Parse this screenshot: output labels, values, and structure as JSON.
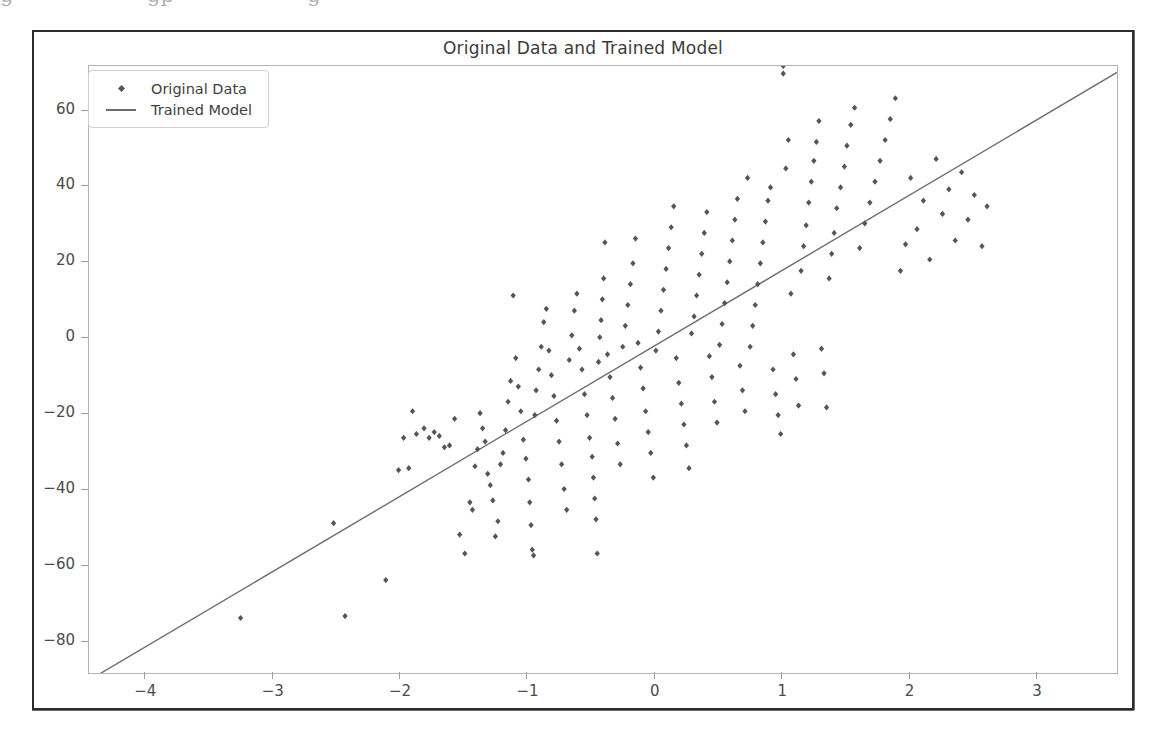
{
  "figure": {
    "title": "Original Data and Trained Model",
    "background": "#ffffff",
    "frame_color": "#2c2c2c",
    "axes_color": "#b4b4b4"
  },
  "page_artifact": {
    "cut_text_fragment": "g                    gp                    g"
  },
  "legend": {
    "position": "upper left",
    "entries": [
      {
        "label": "Original Data",
        "key": "marker",
        "color": "#555555"
      },
      {
        "label": "Trained Model",
        "key": "line",
        "color": "#6d6d6d"
      }
    ]
  },
  "chart_data": {
    "type": "scatter",
    "title": "Original Data and Trained Model",
    "xlabel": "",
    "ylabel": "",
    "xlim": [
      -4.45,
      3.62
    ],
    "ylim": [
      -88.0,
      72.0
    ],
    "xticks": [
      -4,
      -3,
      -2,
      -1,
      0,
      1,
      2,
      3
    ],
    "yticks": [
      -80,
      -60,
      -40,
      -20,
      0,
      20,
      40,
      60
    ],
    "xtick_labels": [
      "−4",
      "−3",
      "−2",
      "−1",
      "0",
      "1",
      "2",
      "3"
    ],
    "ytick_labels": [
      "−80",
      "−60",
      "−40",
      "−20",
      "0",
      "20",
      "40",
      "60"
    ],
    "grid": false,
    "legend_position": "upper left",
    "series": [
      {
        "name": "Original Data",
        "type": "scatter",
        "color": "#555555",
        "marker": "diamond",
        "marker_size": 5,
        "n_points": 200,
        "x": [
          -3.26,
          -2.53,
          -2.44,
          -2.12,
          -2.02,
          -1.98,
          -1.94,
          -1.91,
          -1.88,
          -1.82,
          -1.78,
          -1.74,
          -1.7,
          -1.66,
          -1.62,
          -1.58,
          -1.54,
          -1.5,
          -1.46,
          -1.44,
          -1.42,
          -1.4,
          -1.38,
          -1.36,
          -1.34,
          -1.32,
          -1.3,
          -1.28,
          -1.26,
          -1.24,
          -1.22,
          -1.2,
          -1.18,
          -1.16,
          -1.14,
          -1.12,
          -1.1,
          -1.08,
          -1.06,
          -1.04,
          -1.02,
          -1.0,
          -0.99,
          -0.98,
          -0.97,
          -0.96,
          -0.95,
          -0.94,
          -0.92,
          -0.9,
          -0.88,
          -0.86,
          -0.84,
          -0.82,
          -0.8,
          -0.78,
          -0.76,
          -0.74,
          -0.72,
          -0.7,
          -0.68,
          -0.66,
          -0.64,
          -0.62,
          -0.6,
          -0.58,
          -0.56,
          -0.54,
          -0.52,
          -0.5,
          -0.49,
          -0.48,
          -0.47,
          -0.46,
          -0.45,
          -0.44,
          -0.43,
          -0.42,
          -0.41,
          -0.4,
          -0.38,
          -0.36,
          -0.34,
          -0.32,
          -0.3,
          -0.28,
          -0.26,
          -0.24,
          -0.22,
          -0.2,
          -0.18,
          -0.16,
          -0.14,
          -0.12,
          -0.1,
          -0.08,
          -0.06,
          -0.04,
          -0.02,
          0.0,
          0.02,
          0.04,
          0.06,
          0.08,
          0.1,
          0.12,
          0.14,
          0.16,
          0.18,
          0.2,
          0.22,
          0.24,
          0.26,
          0.28,
          0.3,
          0.32,
          0.34,
          0.36,
          0.38,
          0.4,
          0.42,
          0.44,
          0.46,
          0.48,
          0.5,
          0.52,
          0.54,
          0.56,
          0.58,
          0.6,
          0.62,
          0.64,
          0.66,
          0.68,
          0.7,
          0.72,
          0.74,
          0.76,
          0.78,
          0.8,
          0.82,
          0.84,
          0.86,
          0.88,
          0.9,
          0.92,
          0.94,
          0.96,
          0.98,
          1.0,
          1.02,
          1.04,
          1.06,
          1.08,
          1.1,
          1.12,
          1.14,
          1.16,
          1.18,
          1.2,
          1.22,
          1.24,
          1.26,
          1.28,
          1.3,
          1.32,
          1.34,
          1.36,
          1.38,
          1.4,
          1.42,
          1.45,
          1.48,
          1.5,
          1.53,
          1.56,
          1.6,
          1.64,
          1.68,
          1.72,
          1.76,
          1.8,
          1.84,
          1.88,
          1.92,
          1.96,
          2.0,
          2.05,
          2.1,
          2.15,
          2.2,
          2.25,
          2.3,
          2.35,
          2.4,
          2.45,
          2.5,
          2.56,
          2.6,
          1.0
        ],
        "y": [
          -73.5,
          -48.5,
          -73.0,
          -63.5,
          -34.5,
          -26.0,
          -34.0,
          -19.0,
          -25.0,
          -23.5,
          -26.0,
          -24.5,
          -25.5,
          -28.5,
          -28.0,
          -21.0,
          -51.5,
          -56.5,
          -43.0,
          -45.0,
          -33.5,
          -29.0,
          -19.5,
          -23.5,
          -27.0,
          -35.5,
          -38.5,
          -42.5,
          -52.0,
          -48.0,
          -33.0,
          -30.0,
          -24.0,
          -16.5,
          -11.0,
          11.5,
          -5.0,
          -12.5,
          -19.0,
          -26.5,
          -31.5,
          -37.0,
          -43.0,
          -49.0,
          -55.5,
          -57.0,
          -20.0,
          -13.5,
          -8.0,
          -2.0,
          4.5,
          8.0,
          -3.0,
          -9.5,
          -15.0,
          -21.5,
          -27.0,
          -33.0,
          -39.5,
          -45.0,
          -5.5,
          1.0,
          7.5,
          12.0,
          -2.5,
          -8.0,
          -14.5,
          -20.0,
          -26.0,
          -31.0,
          -36.5,
          -42.0,
          -47.5,
          -56.5,
          -6.0,
          0.5,
          5.0,
          10.5,
          16.0,
          25.5,
          -4.0,
          -10.0,
          -15.5,
          -21.0,
          -27.5,
          -33.0,
          -2.0,
          3.5,
          9.0,
          14.5,
          20.0,
          26.5,
          -1.0,
          -7.5,
          -13.0,
          -19.0,
          -24.5,
          -30.0,
          -36.5,
          -3.0,
          2.0,
          7.5,
          13.0,
          18.5,
          24.0,
          29.5,
          35.0,
          -5.0,
          -11.5,
          -17.0,
          -22.5,
          -28.0,
          -34.0,
          1.5,
          6.0,
          11.5,
          17.0,
          22.5,
          28.0,
          33.5,
          -4.5,
          -10.0,
          -16.5,
          -22.0,
          -1.5,
          4.0,
          9.5,
          15.0,
          20.5,
          26.0,
          31.5,
          37.0,
          -7.0,
          -13.5,
          -19.0,
          42.5,
          -2.0,
          3.5,
          9.0,
          14.5,
          20.0,
          25.5,
          31.0,
          36.5,
          40.0,
          -8.0,
          -14.5,
          -20.0,
          -25.0,
          72.0,
          45.0,
          52.5,
          12.0,
          -4.0,
          -10.5,
          -17.5,
          18.0,
          24.5,
          30.0,
          36.0,
          41.5,
          47.0,
          52.0,
          57.5,
          -2.5,
          -9.0,
          -18.0,
          16.0,
          22.5,
          28.0,
          34.5,
          40.0,
          45.5,
          51.0,
          56.5,
          61.0,
          24.0,
          30.5,
          36.0,
          41.5,
          47.0,
          52.5,
          58.0,
          63.5,
          18.0,
          25.0,
          42.5,
          29.0,
          36.5,
          21.0,
          47.5,
          33.0,
          39.5,
          26.0,
          44.0,
          31.5,
          38.0,
          24.5,
          35.0,
          70.0
        ]
      },
      {
        "name": "Trained Model",
        "type": "line",
        "color": "#6d6d6d",
        "linewidth": 1.4,
        "slope": 19.85,
        "intercept": -1.6,
        "endpoints_x": [
          -4.45,
          3.62
        ],
        "endpoints_y": [
          -89.9,
          70.3
        ]
      }
    ]
  }
}
